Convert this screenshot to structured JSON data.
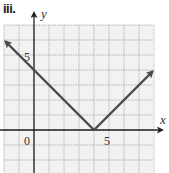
{
  "label": "iii.",
  "chart_data": {
    "type": "line",
    "title": "iii.",
    "xlabel": "x",
    "ylabel": "y",
    "function": "y = |x - 4|",
    "series": [
      {
        "name": "y = |x - 4|",
        "x": [
          -1.9,
          0,
          4,
          7.9
        ],
        "y": [
          5.9,
          4,
          0,
          3.9
        ],
        "arrows_at_ends": true,
        "color": "#555555"
      }
    ],
    "vertex": [
      4,
      0
    ],
    "y_intercept": 4,
    "xlim": [
      -2,
      8
    ],
    "ylim": [
      -2,
      7
    ],
    "tick_labels": {
      "origin": "0",
      "x": [
        "5"
      ],
      "y": [
        "5"
      ]
    },
    "grid": true,
    "grid_step": 1,
    "colors": {
      "grid": "#9a9a9a",
      "grid_bg": "#f2f2f2",
      "axis": "#222222",
      "line": "#555555"
    }
  }
}
